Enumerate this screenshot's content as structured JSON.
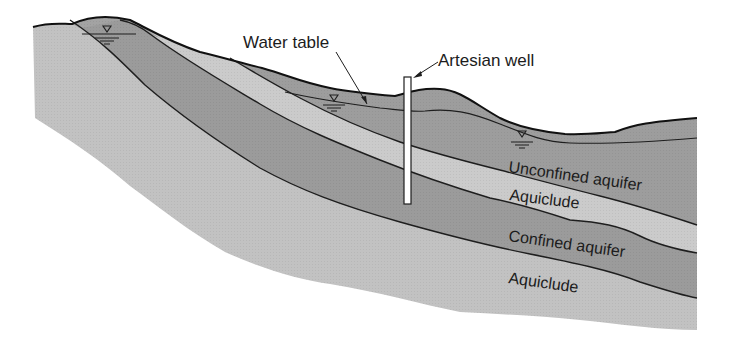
{
  "diagram": {
    "type": "geological-cross-section",
    "colors": {
      "background": "#ffffff",
      "aquifer": "#9a9a9a",
      "aquiclude": "#c8c8c8",
      "base_rock": "#bdbdbd",
      "outline": "#1e1e1e",
      "well": "#ffffff"
    },
    "labels": {
      "water_table": "Water table",
      "artesian_well": "Artesian well",
      "unconfined_aquifer": "Unconfined aquifer",
      "aquiclude_upper": "Aquiclude",
      "confined_aquifer": "Confined aquifer",
      "aquiclude_lower": "Aquiclude"
    },
    "symbols": [
      {
        "name": "water-level-symbol",
        "glyph": "▽",
        "location": "left hill"
      },
      {
        "name": "water-level-symbol",
        "glyph": "▽",
        "location": "near water table arrow"
      },
      {
        "name": "water-level-symbol",
        "glyph": "▽",
        "location": "right unconfined aquifer"
      }
    ],
    "layers_top_to_bottom": [
      "Unconfined aquifer",
      "Aquiclude",
      "Confined aquifer",
      "Aquiclude"
    ]
  }
}
